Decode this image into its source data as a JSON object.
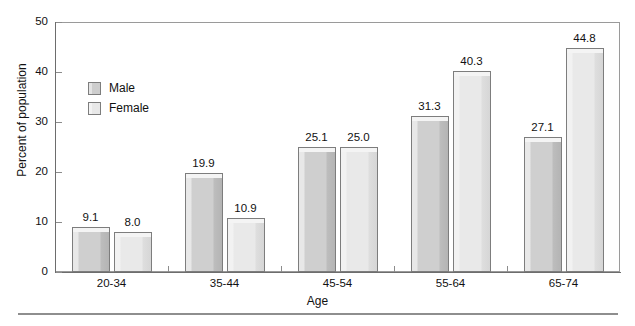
{
  "chart_data": {
    "type": "bar",
    "title": "",
    "subtitle": "",
    "xlabel": "Age",
    "ylabel": "Percent of population",
    "categories": [
      "20-34",
      "35-44",
      "45-54",
      "55-64",
      "65-74"
    ],
    "series": [
      {
        "name": "Male",
        "values": [
          9.1,
          19.9,
          25.1,
          31.3,
          27.1
        ]
      },
      {
        "name": "Female",
        "values": [
          8.0,
          10.9,
          25.0,
          40.3,
          44.8
        ]
      }
    ],
    "value_labels": [
      [
        "9.1",
        "19.9",
        "25.1",
        "31.3",
        "27.1"
      ],
      [
        "8.0",
        "10.9",
        "25.0",
        "40.3",
        "44.8"
      ]
    ],
    "ylim": [
      0,
      50
    ],
    "yticks": [
      0,
      10,
      20,
      30,
      40,
      50
    ],
    "ytick_labels": [
      "0",
      "10",
      "20",
      "30",
      "40",
      "50"
    ],
    "grid": false,
    "legend_position": "upper-left-inside",
    "colors": {
      "male_fill": "#cfcfcf",
      "female_fill": "#e9e9e9",
      "bar_outline": "#7d7d7d",
      "axis": "#6d6d6d",
      "frame": "#9a9a9a",
      "text": "#111111",
      "rule": "#8e8e8e"
    }
  },
  "axes": {
    "y_title": "Percent of population",
    "x_title": "Age"
  },
  "legend": {
    "items": [
      {
        "label": "Male",
        "swatch": "male-swatch"
      },
      {
        "label": "Female",
        "swatch": "female-swatch"
      }
    ]
  }
}
